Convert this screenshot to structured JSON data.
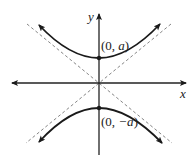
{
  "diagram": {
    "type": "hyperbola",
    "axes": {
      "x_label": "x",
      "y_label": "y"
    },
    "vertices": [
      {
        "label": "(0, a)",
        "open": "(0, ",
        "var": "a",
        "close": ")"
      },
      {
        "label": "(0, −a)",
        "open": "(0, ",
        "var": "−a",
        "close": ")"
      }
    ],
    "asymptotes": "dashed lines through origin",
    "colors": {
      "curve": "#1a1a1a",
      "axis": "#222222",
      "asymptote": "#777777"
    }
  }
}
